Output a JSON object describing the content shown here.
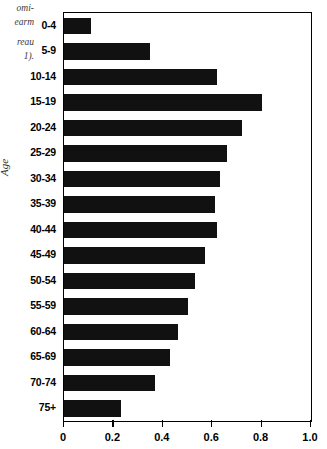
{
  "caption": {
    "lines": [
      "omi-",
      "earm",
      "reau",
      "1)."
    ],
    "note": "partially cropped italic caption fragment at left margin"
  },
  "chart_data": {
    "type": "bar",
    "orientation": "horizontal",
    "title": "",
    "xlabel": "",
    "ylabel": "Age",
    "categories": [
      "0-4",
      "5-9",
      "10-14",
      "15-19",
      "20-24",
      "25-29",
      "30-34",
      "35-39",
      "40-44",
      "45-49",
      "50-54",
      "55-59",
      "60-64",
      "65-69",
      "70-74",
      "75+"
    ],
    "values": [
      0.11,
      0.35,
      0.62,
      0.8,
      0.72,
      0.66,
      0.63,
      0.61,
      0.62,
      0.57,
      0.53,
      0.5,
      0.46,
      0.43,
      0.37,
      0.23
    ],
    "xlim": [
      0,
      1.0
    ],
    "xticks": [
      0,
      0.2,
      0.4,
      0.6,
      0.8,
      1.0
    ],
    "xticklabels": [
      "0",
      "0.2",
      "0.4",
      "0.6",
      "0.8",
      "1.0"
    ],
    "grid": false,
    "legend": null,
    "bar_color": "#111111"
  }
}
